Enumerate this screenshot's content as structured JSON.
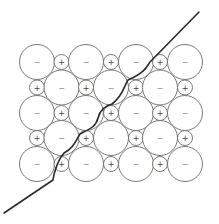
{
  "diagram": {
    "title": "",
    "colors": {
      "background": "#ffffff",
      "circle_stroke": "#6a6a6a",
      "line": "#2a2a2a"
    },
    "symbols": {
      "anion": "−",
      "cation": "+"
    },
    "grid": {
      "columns_x": [
        37,
        61.5,
        86,
        111,
        136,
        160,
        185
      ],
      "rows_y": [
        62,
        87.5,
        113,
        138,
        164
      ],
      "large_radius": 17.5,
      "small_radius": 7.5
    },
    "rows": [
      {
        "cells": [
          "−",
          "+",
          "−",
          "+",
          "−",
          "+",
          "−"
        ]
      },
      {
        "cells": [
          "+",
          "−",
          "+",
          "−",
          "+",
          "−",
          "+"
        ]
      },
      {
        "cells": [
          "−",
          "+",
          "−",
          "+",
          "−",
          "+",
          "−"
        ]
      },
      {
        "cells": [
          "+",
          "−",
          "+",
          "−",
          "+",
          "−",
          "+"
        ]
      },
      {
        "cells": [
          "−",
          "+",
          "−",
          "+",
          "−",
          "+",
          "−"
        ]
      }
    ],
    "fracture_line": {
      "start": [
        199,
        12
      ],
      "end": [
        4,
        213
      ]
    }
  }
}
